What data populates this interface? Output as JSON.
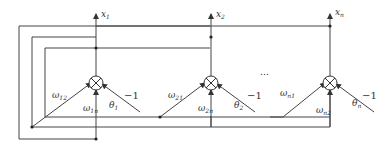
{
  "diagram": {
    "type": "neural-network-feedback",
    "nodes": [
      {
        "id": "node-1",
        "output": {
          "base": "x",
          "sub": "1"
        },
        "inputs": [
          {
            "base": "ω",
            "sub": "12"
          },
          {
            "base": "ω",
            "sub": "1n"
          }
        ],
        "threshold": {
          "base": "θ",
          "sub": "1"
        },
        "bias": "−1"
      },
      {
        "id": "node-2",
        "output": {
          "base": "x",
          "sub": "2"
        },
        "inputs": [
          {
            "base": "ω",
            "sub": "21"
          },
          {
            "base": "ω",
            "sub": "2n"
          }
        ],
        "threshold": {
          "base": "θ",
          "sub": "2"
        },
        "bias": "−1"
      },
      {
        "id": "node-n",
        "output": {
          "base": "x",
          "sub": "n"
        },
        "inputs": [
          {
            "base": "ω",
            "sub": "n1"
          },
          {
            "base": "ω",
            "sub": "n2"
          }
        ],
        "threshold": {
          "base": "θ",
          "sub": "n"
        },
        "bias": "−1"
      }
    ],
    "ellipsis": "…"
  }
}
